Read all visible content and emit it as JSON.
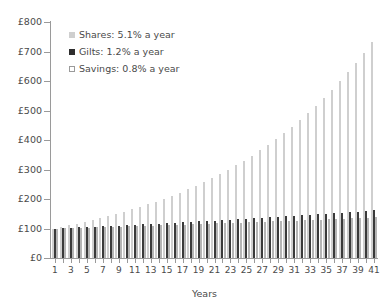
{
  "chart_data": {
    "type": "bar",
    "title": "",
    "xlabel": "Years",
    "ylabel": "",
    "ylim": [
      0,
      800
    ],
    "y_ticks": [
      0,
      100,
      200,
      300,
      400,
      500,
      600,
      700,
      800
    ],
    "y_tick_labels": [
      "£0",
      "£100",
      "£200",
      "£300",
      "£400",
      "£500",
      "£600",
      "£700",
      "£800"
    ],
    "y_tick_prefix": "£",
    "grid": false,
    "legend_position": "top-left",
    "categories": [
      1,
      2,
      3,
      4,
      5,
      6,
      7,
      8,
      9,
      10,
      11,
      12,
      13,
      14,
      15,
      16,
      17,
      18,
      19,
      20,
      21,
      22,
      23,
      24,
      25,
      26,
      27,
      28,
      29,
      30,
      31,
      32,
      33,
      34,
      35,
      36,
      37,
      38,
      39,
      40,
      41
    ],
    "x_tick_labels": [
      "1",
      "3",
      "5",
      "7",
      "9",
      "11",
      "13",
      "15",
      "17",
      "19",
      "21",
      "23",
      "25",
      "27",
      "29",
      "31",
      "33",
      "35",
      "37",
      "39",
      "41"
    ],
    "series": [
      {
        "name": "Shares: 5.1% a year",
        "short_name": "Shares",
        "rate_label": "5.1% a year",
        "rate": 5.1,
        "color": "#cfcfcf",
        "values": [
          100,
          105.1,
          110.5,
          116.1,
          122.0,
          128.2,
          134.8,
          141.7,
          148.9,
          156.5,
          164.5,
          172.9,
          181.7,
          191.0,
          200.7,
          211.0,
          221.7,
          233.0,
          244.9,
          257.4,
          270.5,
          284.3,
          298.8,
          314.1,
          330.1,
          346.9,
          364.6,
          383.2,
          402.8,
          423.3,
          444.9,
          467.6,
          491.5,
          516.5,
          542.9,
          570.6,
          599.7,
          630.3,
          662.4,
          696.2,
          731.7
        ]
      },
      {
        "name": "Gilts: 1.2% a year",
        "short_name": "Gilts",
        "rate_label": "1.2% a year",
        "rate": 1.2,
        "color": "#3a3a3a",
        "values": [
          100,
          101.2,
          102.4,
          103.6,
          104.9,
          106.2,
          107.4,
          108.7,
          110.0,
          111.4,
          112.7,
          114.1,
          115.4,
          116.8,
          118.2,
          119.7,
          121.1,
          122.6,
          124.0,
          125.5,
          127.0,
          128.6,
          130.1,
          131.7,
          133.3,
          134.9,
          136.5,
          138.1,
          139.8,
          141.5,
          143.2,
          144.9,
          146.7,
          148.4,
          150.2,
          152.0,
          153.8,
          155.7,
          157.6,
          159.4,
          161.4
        ]
      },
      {
        "name": "Savings: 0.8% a year",
        "short_name": "Savings",
        "rate_label": "0.8% a year",
        "rate": 0.8,
        "color": "#ffffff",
        "values": [
          100,
          100.8,
          101.6,
          102.4,
          103.2,
          104.1,
          104.9,
          105.7,
          106.6,
          107.4,
          108.3,
          109.2,
          110.0,
          110.9,
          111.8,
          112.7,
          113.6,
          114.5,
          115.4,
          116.3,
          117.3,
          118.2,
          119.1,
          120.1,
          121.1,
          122.0,
          123.0,
          124.0,
          125.0,
          126.0,
          127.0,
          128.0,
          129.0,
          130.1,
          131.1,
          132.2,
          133.2,
          134.3,
          135.4,
          136.5,
          137.6
        ]
      }
    ]
  },
  "legend": {
    "items": [
      {
        "label": "Shares: 5.1% a year",
        "swatch": "shares"
      },
      {
        "label": "Gilts: 1.2% a year",
        "swatch": "gilts"
      },
      {
        "label": "Savings: 0.8% a year",
        "swatch": "savings"
      }
    ]
  },
  "axis": {
    "x_title": "Years"
  }
}
